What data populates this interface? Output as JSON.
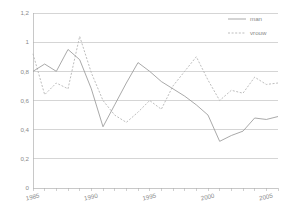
{
  "chart_data": {
    "type": "line",
    "title": "",
    "subtitle": "",
    "xlabel": "",
    "ylabel": "",
    "x": [
      1985,
      1986,
      1987,
      1988,
      1989,
      1990,
      1991,
      1992,
      1993,
      1994,
      1995,
      1996,
      1997,
      1998,
      1999,
      2000,
      2001,
      2002,
      2003,
      2004,
      2005,
      2006
    ],
    "xlim": [
      1985,
      2006
    ],
    "ylim": [
      0,
      1.2
    ],
    "grid": true,
    "grid_axis": "y",
    "legend_position": "top-right",
    "y_tick_labels": [
      "1,2",
      "1",
      "0,8",
      "0,6",
      "0,4",
      "0,2",
      "0"
    ],
    "y_tick_values": [
      1.2,
      1.0,
      0.8,
      0.6,
      0.4,
      0.2,
      0
    ],
    "x_tick_labels": [
      "1985",
      "1990",
      "1995",
      "2000",
      "2005"
    ],
    "x_tick_values": [
      1985,
      1990,
      1995,
      2000,
      2005
    ],
    "series": [
      {
        "name": "man",
        "style": "solid",
        "color": "#9a9a9a",
        "values": [
          0.8,
          0.85,
          0.8,
          0.95,
          0.88,
          0.68,
          0.42,
          0.57,
          0.72,
          0.86,
          0.8,
          0.73,
          0.68,
          0.63,
          0.57,
          0.5,
          0.32,
          0.36,
          0.39,
          0.48,
          0.47,
          0.49
        ]
      },
      {
        "name": "vrouw",
        "style": "dotted",
        "color": "#b5b5b5",
        "values": [
          0.92,
          0.64,
          0.72,
          0.68,
          1.04,
          0.79,
          0.6,
          0.5,
          0.45,
          0.52,
          0.6,
          0.54,
          0.7,
          0.8,
          0.9,
          0.74,
          0.6,
          0.67,
          0.65,
          0.76,
          0.71,
          0.72
        ]
      }
    ]
  },
  "legend": {
    "items": [
      {
        "label": "man"
      },
      {
        "label": "vrouw"
      }
    ]
  }
}
